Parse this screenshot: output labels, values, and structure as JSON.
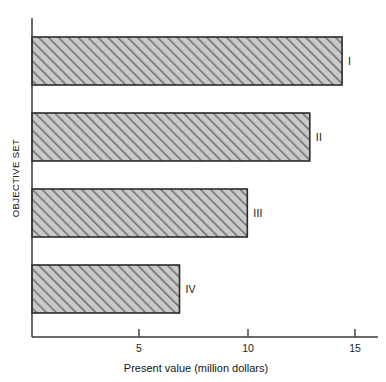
{
  "chart_data": {
    "type": "bar",
    "orientation": "horizontal",
    "title": "",
    "xlabel": "Present value (million dollars)",
    "ylabel": "OBJECTIVE SET",
    "categories": [
      "I",
      "II",
      "III",
      "IV"
    ],
    "values": [
      14.4,
      12.9,
      10.0,
      6.85
    ],
    "xlim": [
      0,
      16.4
    ],
    "ylim": [
      0,
      4
    ],
    "xticks": [
      5,
      10,
      15
    ],
    "xtick_labels": [
      "5",
      "10",
      "15"
    ],
    "yticks": [],
    "ytick_labels": [],
    "grid": false,
    "legend": null,
    "series": [
      {
        "name": "Present value",
        "values": [
          14.4,
          12.9,
          10.0,
          6.85
        ]
      }
    ],
    "bar_fill": "#b8b8b8",
    "bar_hatch": "diagonal-forward",
    "bar_edge_color": "#2b2b2b",
    "background": "#ffffff",
    "axis_color": "#3a3a3a"
  },
  "bars": [
    {
      "label": "I",
      "value": 14.4
    },
    {
      "label": "II",
      "value": 12.9
    },
    {
      "label": "III",
      "value": 10.0
    },
    {
      "label": "IV",
      "value": 6.85
    }
  ],
  "axis": {
    "x_title": "Present value (million dollars)",
    "y_title": "OBJECTIVE SET",
    "tick_5": "5",
    "tick_10": "10",
    "tick_15": "15"
  }
}
